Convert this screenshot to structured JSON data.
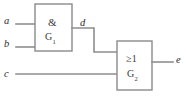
{
  "diagram": {
    "colors": {
      "wire": "#8e8e8e",
      "gate_border": "#8b8b8b",
      "gate_fill": "#ffffff",
      "text": "#2b2b2b",
      "background": "#ffffff"
    },
    "signals": {
      "input_a": "a",
      "input_b": "b",
      "input_c": "c",
      "intermediate_d": "d",
      "output_e": "e"
    },
    "gates": [
      {
        "id": "and-gate",
        "symbol": "&",
        "name_base": "G",
        "name_sub": "1",
        "inputs": [
          "a",
          "b"
        ],
        "output": "d"
      },
      {
        "id": "or-gate",
        "symbol": "≥1",
        "name_base": "G",
        "name_sub": "2",
        "inputs": [
          "d",
          "c"
        ],
        "output": "e"
      }
    ]
  }
}
